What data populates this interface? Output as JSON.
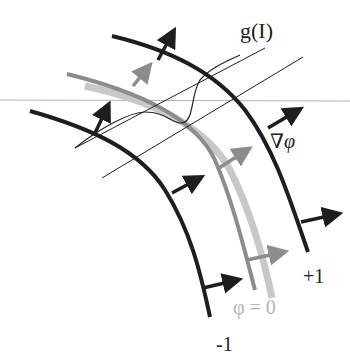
{
  "diagram": {
    "labels": {
      "g_of_I": "g(I)",
      "grad_phi": "∇φ",
      "plus_one": "+1",
      "phi_zero": "φ = 0",
      "minus_one": "-1"
    },
    "colors": {
      "contour_plus": "#1e1e1e",
      "contour_minus": "#1e1e1e",
      "zero_level": "#8c8c8c",
      "zero_level_band": "#c8c8c8",
      "horizon_line": "#b4b4b4",
      "thin_lines": "#222222"
    },
    "contours": [
      {
        "name": "+1 level",
        "label": "+1"
      },
      {
        "name": "zero level",
        "label": "φ = 0"
      },
      {
        "name": "-1 level",
        "label": "-1"
      }
    ]
  }
}
